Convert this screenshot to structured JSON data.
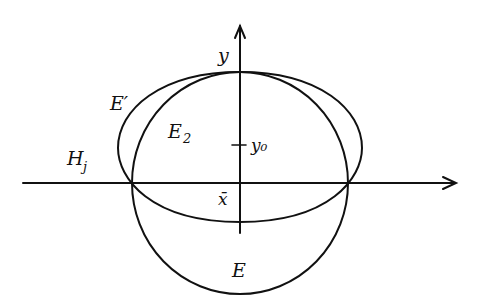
{
  "diagram": {
    "labels": {
      "y_axis": "y",
      "y0": "y₀",
      "x_bar": "x̄",
      "E_prime": "E′",
      "E2": "E",
      "E2_sub": "2",
      "H": "H",
      "H_sub": "j",
      "E": "E"
    },
    "elements": [
      {
        "id": "x-axis",
        "kind": "arrow",
        "label": "H_j"
      },
      {
        "id": "y-axis",
        "kind": "arrow",
        "label": "y"
      },
      {
        "id": "ellipse-E-prime",
        "kind": "ellipse",
        "label": "E'"
      },
      {
        "id": "ellipse-E",
        "kind": "ellipse",
        "label": "E"
      },
      {
        "id": "half-ellipse-E2",
        "kind": "region",
        "label": "E_2"
      },
      {
        "id": "tick-y0",
        "kind": "tick",
        "label": "y_0"
      },
      {
        "id": "point-x-bar",
        "kind": "point",
        "label": "x̄"
      }
    ],
    "colors": {
      "ink": "#111111",
      "background": "#ffffff"
    }
  }
}
